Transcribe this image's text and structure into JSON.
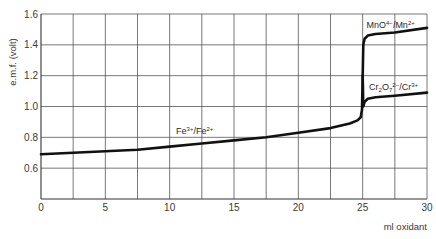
{
  "chart_data": {
    "type": "line",
    "title": "",
    "xlabel": "ml oxidant",
    "ylabel": "e.m.f. (volt)",
    "xlim": [
      0,
      30
    ],
    "ylim": [
      0.4,
      1.6
    ],
    "x_ticks": [
      0,
      5,
      10,
      15,
      20,
      25,
      30
    ],
    "x_tick_labels": [
      "0",
      "5",
      "10",
      "15",
      "20",
      "25",
      "30"
    ],
    "x_grid_step": 2.5,
    "y_ticks": [
      0.6,
      0.8,
      1.0,
      1.2,
      1.4,
      1.6
    ],
    "y_tick_labels": [
      "0.6",
      "0.8",
      "1.0",
      "1.2",
      "1.4",
      "1.6"
    ],
    "y_grid_step": 0.2,
    "grid": true,
    "legend": "none",
    "series": [
      {
        "name": "Fe3+/Fe2+ (MnO4-/Mn2+ titration)",
        "x": [
          0,
          2.5,
          5,
          7.5,
          10,
          12.5,
          15,
          17.5,
          20,
          22.5,
          24,
          24.6,
          24.85,
          24.95,
          25.0,
          25.05,
          25.15,
          25.4,
          26,
          27.5,
          30
        ],
        "y": [
          0.69,
          0.7,
          0.71,
          0.72,
          0.74,
          0.76,
          0.78,
          0.8,
          0.83,
          0.86,
          0.89,
          0.91,
          0.93,
          0.98,
          1.2,
          1.4,
          1.44,
          1.46,
          1.47,
          1.48,
          1.51
        ]
      },
      {
        "name": "Cr2O7 2-/Cr3+ branch",
        "x": [
          25.0,
          25.05,
          25.15,
          25.4,
          26,
          27.5,
          30
        ],
        "y": [
          1.2,
          1.0,
          1.03,
          1.05,
          1.06,
          1.07,
          1.09
        ]
      }
    ],
    "annotations": [
      {
        "text_main": "MnO",
        "sup1": "4−",
        "text_mid": "/Mn",
        "sup2": "2+",
        "x": 25.3,
        "y": 1.51
      },
      {
        "text_main": "Cr",
        "sub1": "2",
        "text_o": "O",
        "sub2": "7",
        "sup1": "2−",
        "text_mid": "/Cr",
        "sup2": "3+",
        "x": 25.5,
        "y": 1.11
      },
      {
        "text_main": "Fe",
        "sup1": "3+",
        "text_mid": "/Fe",
        "sup2": "2+",
        "x": 10.5,
        "y": 0.82
      }
    ]
  }
}
